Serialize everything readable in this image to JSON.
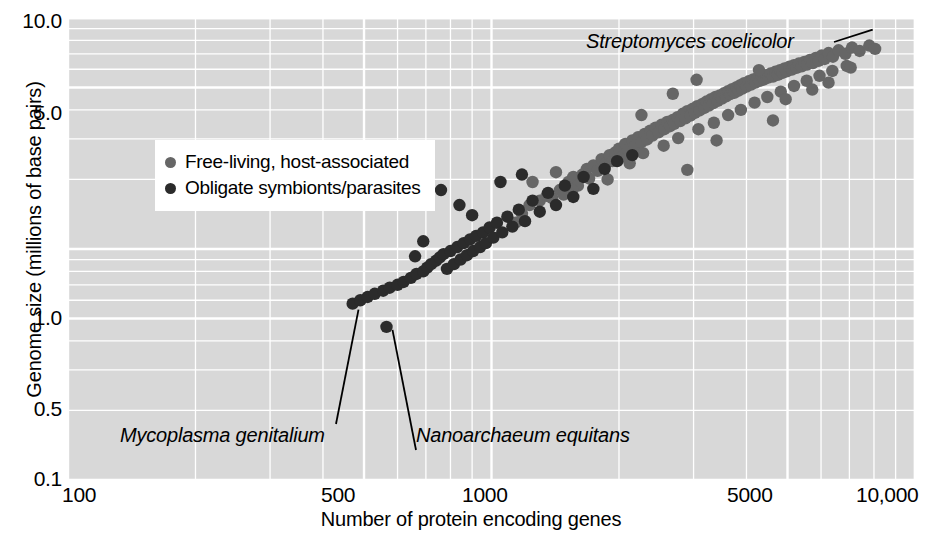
{
  "chart_data": {
    "type": "scatter",
    "title": "",
    "xlabel": "Number of protein encoding genes",
    "ylabel": "Genome size (millions of base pairs)",
    "xscale": "log",
    "yscale": "log",
    "xlim": [
      100,
      10000
    ],
    "ylim": [
      0.1,
      10.0
    ],
    "xticks": [
      100,
      500,
      1000,
      5000,
      10000
    ],
    "xticklabels": [
      "100",
      "500",
      "1000",
      "5000",
      "10,000"
    ],
    "yticks": [
      0.1,
      0.5,
      1.0,
      5.0,
      10.0
    ],
    "yticklabels": [
      "0.1",
      "0.5",
      "1.0",
      "5.0",
      "10.0"
    ],
    "grid": true,
    "grid_color": "#ffffff",
    "plot_background": "#d8d8d8",
    "legend_position": "upper left inside",
    "series": [
      {
        "name": "Free-living, host-associated",
        "color": "#666666",
        "points": [
          [
            1140,
            1.3
          ],
          [
            1180,
            1.42
          ],
          [
            1230,
            1.55
          ],
          [
            1300,
            1.62
          ],
          [
            1350,
            1.7
          ],
          [
            1390,
            1.66
          ],
          [
            1450,
            1.8
          ],
          [
            1480,
            1.72
          ],
          [
            1520,
            1.95
          ],
          [
            1560,
            2.05
          ],
          [
            1600,
            1.88
          ],
          [
            1640,
            2.1
          ],
          [
            1680,
            2.22
          ],
          [
            1700,
            2.02
          ],
          [
            1740,
            2.3
          ],
          [
            1780,
            2.18
          ],
          [
            1820,
            2.45
          ],
          [
            1860,
            2.35
          ],
          [
            1900,
            2.55
          ],
          [
            1930,
            2.4
          ],
          [
            1960,
            2.62
          ],
          [
            2000,
            2.72
          ],
          [
            2030,
            2.5
          ],
          [
            2070,
            2.85
          ],
          [
            2100,
            2.68
          ],
          [
            2150,
            2.95
          ],
          [
            2180,
            2.78
          ],
          [
            2220,
            3.05
          ],
          [
            2260,
            2.9
          ],
          [
            2300,
            3.15
          ],
          [
            2330,
            2.98
          ],
          [
            2370,
            3.25
          ],
          [
            2400,
            3.1
          ],
          [
            2440,
            3.35
          ],
          [
            2480,
            3.2
          ],
          [
            2520,
            3.45
          ],
          [
            2560,
            3.3
          ],
          [
            2600,
            3.55
          ],
          [
            2640,
            3.4
          ],
          [
            2680,
            3.62
          ],
          [
            2700,
            3.48
          ],
          [
            2750,
            3.72
          ],
          [
            2790,
            3.58
          ],
          [
            2830,
            3.85
          ],
          [
            2870,
            3.68
          ],
          [
            2900,
            3.95
          ],
          [
            2950,
            3.78
          ],
          [
            2990,
            4.05
          ],
          [
            3020,
            3.88
          ],
          [
            3060,
            4.15
          ],
          [
            3100,
            3.98
          ],
          [
            3150,
            4.25
          ],
          [
            3180,
            4.08
          ],
          [
            3220,
            4.35
          ],
          [
            3260,
            4.18
          ],
          [
            3300,
            4.45
          ],
          [
            3340,
            4.28
          ],
          [
            3380,
            4.55
          ],
          [
            3420,
            4.38
          ],
          [
            3460,
            4.62
          ],
          [
            3500,
            4.48
          ],
          [
            3540,
            4.72
          ],
          [
            3580,
            4.58
          ],
          [
            3620,
            4.82
          ],
          [
            3660,
            4.68
          ],
          [
            3700,
            4.92
          ],
          [
            3750,
            4.75
          ],
          [
            3790,
            5.02
          ],
          [
            3830,
            4.85
          ],
          [
            3870,
            5.12
          ],
          [
            3910,
            4.95
          ],
          [
            3950,
            5.22
          ],
          [
            4000,
            5.05
          ],
          [
            4050,
            5.32
          ],
          [
            4100,
            5.15
          ],
          [
            4150,
            5.42
          ],
          [
            4200,
            5.25
          ],
          [
            4250,
            5.5
          ],
          [
            4300,
            5.35
          ],
          [
            4350,
            5.58
          ],
          [
            4400,
            5.42
          ],
          [
            4450,
            5.65
          ],
          [
            4500,
            5.52
          ],
          [
            4560,
            5.75
          ],
          [
            4620,
            5.58
          ],
          [
            4680,
            5.85
          ],
          [
            4740,
            5.68
          ],
          [
            4800,
            5.95
          ],
          [
            4860,
            5.78
          ],
          [
            4920,
            6.05
          ],
          [
            4980,
            5.88
          ],
          [
            5050,
            6.15
          ],
          [
            5120,
            5.98
          ],
          [
            5180,
            6.25
          ],
          [
            5250,
            6.08
          ],
          [
            5320,
            6.35
          ],
          [
            5400,
            6.18
          ],
          [
            5480,
            6.45
          ],
          [
            5560,
            6.28
          ],
          [
            5650,
            6.58
          ],
          [
            5740,
            6.38
          ],
          [
            5830,
            6.72
          ],
          [
            5920,
            6.52
          ],
          [
            6020,
            6.88
          ],
          [
            6120,
            6.65
          ],
          [
            6250,
            7.05
          ],
          [
            6400,
            6.8
          ],
          [
            6600,
            7.25
          ],
          [
            6850,
            7.0
          ],
          [
            7100,
            7.45
          ],
          [
            7400,
            7.2
          ],
          [
            7800,
            7.6
          ],
          [
            1250,
            1.95
          ],
          [
            1420,
            2.15
          ],
          [
            1550,
            1.8
          ],
          [
            1880,
            2.0
          ],
          [
            2120,
            2.35
          ],
          [
            2280,
            2.6
          ],
          [
            2550,
            2.8
          ],
          [
            2760,
            3.02
          ],
          [
            3080,
            3.3
          ],
          [
            3350,
            3.52
          ],
          [
            3620,
            3.8
          ],
          [
            3880,
            4.0
          ],
          [
            4180,
            4.3
          ],
          [
            4480,
            4.55
          ],
          [
            4820,
            4.8
          ],
          [
            5180,
            5.08
          ],
          [
            5550,
            5.35
          ],
          [
            5950,
            5.62
          ],
          [
            6380,
            5.9
          ],
          [
            6900,
            6.2
          ],
          [
            2680,
            4.7
          ],
          [
            3050,
            5.4
          ],
          [
            4280,
            5.95
          ],
          [
            4950,
            4.45
          ],
          [
            5720,
            4.9
          ],
          [
            6250,
            5.25
          ],
          [
            7050,
            6.1
          ],
          [
            8050,
            7.35
          ],
          [
            2900,
            2.2
          ],
          [
            3400,
            2.95
          ],
          [
            2260,
            3.8
          ],
          [
            4620,
            3.6
          ]
        ]
      },
      {
        "name": "Obligate symbionts/parasites",
        "color": "#2b2b2b",
        "points": [
          [
            470,
            0.58
          ],
          [
            490,
            0.6
          ],
          [
            510,
            0.62
          ],
          [
            530,
            0.64
          ],
          [
            555,
            0.66
          ],
          [
            575,
            0.68
          ],
          [
            600,
            0.7
          ],
          [
            620,
            0.72
          ],
          [
            645,
            0.75
          ],
          [
            665,
            0.78
          ],
          [
            690,
            0.8
          ],
          [
            705,
            0.83
          ],
          [
            720,
            0.86
          ],
          [
            740,
            0.89
          ],
          [
            755,
            0.92
          ],
          [
            770,
            0.95
          ],
          [
            785,
            0.82
          ],
          [
            800,
            0.98
          ],
          [
            815,
            0.86
          ],
          [
            830,
            1.02
          ],
          [
            845,
            0.9
          ],
          [
            860,
            1.06
          ],
          [
            875,
            0.94
          ],
          [
            890,
            1.1
          ],
          [
            905,
            0.98
          ],
          [
            920,
            1.14
          ],
          [
            940,
            1.02
          ],
          [
            955,
            1.18
          ],
          [
            970,
            1.06
          ],
          [
            990,
            1.24
          ],
          [
            1010,
            1.12
          ],
          [
            1030,
            1.3
          ],
          [
            1060,
            1.18
          ],
          [
            1090,
            1.38
          ],
          [
            1120,
            1.25
          ],
          [
            1160,
            1.48
          ],
          [
            1200,
            1.32
          ],
          [
            1250,
            1.62
          ],
          [
            1300,
            1.45
          ],
          [
            1360,
            1.75
          ],
          [
            1420,
            1.55
          ],
          [
            1490,
            1.88
          ],
          [
            1560,
            1.68
          ],
          [
            1650,
            2.05
          ],
          [
            1740,
            1.82
          ],
          [
            1850,
            2.22
          ],
          [
            760,
            1.8
          ],
          [
            840,
            1.55
          ],
          [
            900,
            1.4
          ],
          [
            1050,
            1.95
          ],
          [
            1180,
            2.1
          ],
          [
            565,
            0.46
          ],
          [
            1980,
            2.4
          ],
          [
            2150,
            2.55
          ],
          [
            660,
            0.93
          ],
          [
            690,
            1.08
          ]
        ]
      }
    ],
    "annotations": [
      {
        "text": "Streptomyces coelicolor",
        "target_x": 8300,
        "target_y": 8.9
      },
      {
        "text": "Mycoplasma genitalium",
        "target_x": 480,
        "target_y": 0.58
      },
      {
        "text": "Nanoarchaeum equitans",
        "target_x": 565,
        "target_y": 0.46
      }
    ]
  },
  "axis": {
    "x_title": "Number of protein encoding genes",
    "y_title": "Genome size (millions of base pairs)",
    "x_labels": [
      "100",
      "500",
      "1000",
      "5000",
      "10,000"
    ],
    "y_labels": [
      "10.0",
      "5.0",
      "1.0",
      "0.5",
      "0.1"
    ]
  },
  "legend": {
    "items": [
      {
        "label": "Free-living, host-associated",
        "color": "#666666"
      },
      {
        "label": "Obligate symbionts/parasites",
        "color": "#2b2b2b"
      }
    ]
  },
  "annotations": {
    "streptomyces": "Streptomyces coelicolor",
    "mycoplasma": "Mycoplasma genitalium",
    "nanoarchaeum": "Nanoarchaeum equitans"
  }
}
